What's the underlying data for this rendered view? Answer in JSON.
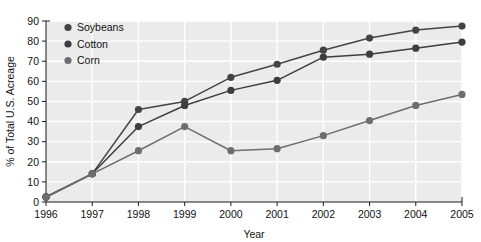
{
  "chart_data": {
    "type": "line",
    "title": "",
    "xlabel": "Year",
    "ylabel": "% of Total U.S. Acreage",
    "x": [
      1996,
      1997,
      1998,
      1999,
      2000,
      2001,
      2002,
      2003,
      2004,
      2005
    ],
    "xtick_labels": [
      "1996",
      "1997",
      "1998",
      "1999",
      "2000",
      "2001",
      "2002",
      "2003",
      "2004",
      "2005"
    ],
    "ytick_labels": [
      "0",
      "10",
      "20",
      "30",
      "40",
      "50",
      "60",
      "70",
      "80",
      "90"
    ],
    "xlim": [
      1996,
      2005
    ],
    "ylim": [
      0,
      90
    ],
    "grid": true,
    "legend_position": "top-left",
    "series": [
      {
        "name": "Soybeans",
        "color": "#444444",
        "values": [
          2.5,
          14,
          46,
          50,
          62,
          68.5,
          75.5,
          81.5,
          85.5,
          87.5
        ]
      },
      {
        "name": "Cotton",
        "color": "#3d3d3d",
        "values": [
          2.5,
          14,
          37.5,
          48,
          55.5,
          60.5,
          72,
          73.5,
          76.5,
          79.5
        ]
      },
      {
        "name": "Corn",
        "color": "#6e6e6e",
        "values": [
          2.5,
          14,
          25.5,
          37.5,
          25.5,
          26.5,
          33,
          40.5,
          48,
          53.5
        ]
      }
    ]
  },
  "style": {
    "plot_background": "#ebebeb",
    "gridline_color": "#ffffff",
    "axis_color": "#1a1a1a",
    "text_color": "#111111"
  }
}
